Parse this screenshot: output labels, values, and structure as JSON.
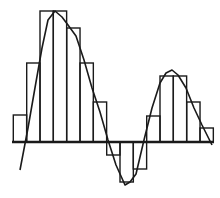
{
  "diagram": {
    "title": "",
    "type": "riemann-sum-rectangles-under-curve",
    "colors": {
      "stroke": "#1a1a1a",
      "background": "#ffffff"
    },
    "baseline_y": 142,
    "bar_width": 13.33,
    "bars": [
      {
        "x": 13.3,
        "top": 115,
        "bottom": 142
      },
      {
        "x": 26.7,
        "top": 63,
        "bottom": 142
      },
      {
        "x": 40.0,
        "top": 11,
        "bottom": 142
      },
      {
        "x": 53.3,
        "top": 11,
        "bottom": 142
      },
      {
        "x": 66.7,
        "top": 28,
        "bottom": 142
      },
      {
        "x": 80.0,
        "top": 63,
        "bottom": 142
      },
      {
        "x": 93.3,
        "top": 102,
        "bottom": 142
      },
      {
        "x": 106.7,
        "top": 142,
        "bottom": 155
      },
      {
        "x": 120.0,
        "top": 142,
        "bottom": 182
      },
      {
        "x": 133.3,
        "top": 142,
        "bottom": 169
      },
      {
        "x": 146.7,
        "top": 116,
        "bottom": 142
      },
      {
        "x": 160.0,
        "top": 76,
        "bottom": 142
      },
      {
        "x": 173.3,
        "top": 76,
        "bottom": 142
      },
      {
        "x": 186.7,
        "top": 102,
        "bottom": 142
      },
      {
        "x": 200.0,
        "top": 128,
        "bottom": 142
      }
    ],
    "curve_points": [
      [
        20,
        170
      ],
      [
        28,
        128
      ],
      [
        36,
        82
      ],
      [
        42,
        48
      ],
      [
        48,
        20
      ],
      [
        55,
        11
      ],
      [
        62,
        17
      ],
      [
        68,
        25
      ],
      [
        76,
        36
      ],
      [
        84,
        60
      ],
      [
        92,
        88
      ],
      [
        100,
        112
      ],
      [
        108,
        140
      ],
      [
        116,
        165
      ],
      [
        125,
        185
      ],
      [
        130,
        182
      ],
      [
        136,
        174
      ],
      [
        144,
        140
      ],
      [
        152,
        108
      ],
      [
        160,
        83
      ],
      [
        166,
        73
      ],
      [
        172,
        70
      ],
      [
        178,
        75
      ],
      [
        186,
        88
      ],
      [
        194,
        108
      ],
      [
        202,
        125
      ],
      [
        212,
        145
      ]
    ]
  }
}
